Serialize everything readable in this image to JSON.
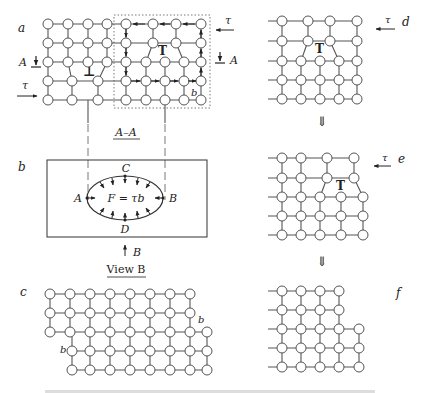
{
  "figure": {
    "panels": {
      "a": {
        "label": "a",
        "section_marker": "A",
        "shear": "τ",
        "burgers": "b",
        "dislocation_symbols": [
          "⊥",
          "T"
        ]
      },
      "b": {
        "label": "b",
        "section_title": "A–A",
        "points": {
          "top": "C",
          "left": "A",
          "right": "B",
          "bottom": "D"
        },
        "force_equation": "F = τb",
        "view_arrow_label": "B",
        "view_title": "View B"
      },
      "c": {
        "label": "c",
        "burgers_top": "b",
        "burgers_left": "b"
      },
      "d": {
        "label": "d",
        "shear": "τ"
      },
      "e": {
        "label": "e",
        "shear": "τ"
      },
      "f": {
        "label": "f"
      }
    },
    "transition_arrow": "⇓",
    "colors": {
      "line": "#555555",
      "atom_fill": "#ffffff",
      "text": "#222222"
    }
  }
}
